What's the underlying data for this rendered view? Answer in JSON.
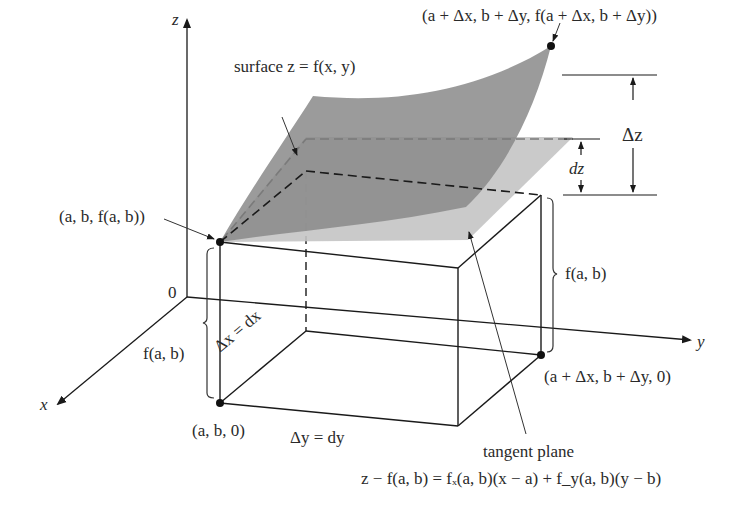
{
  "diagram": {
    "axes": {
      "z_label": "z",
      "x_label": "x",
      "y_label": "y",
      "origin_label": "0"
    },
    "labels": {
      "top_point": "(a + Δx, b + Δy, f(a + Δx, b + Δy))",
      "surface": "surface z = f(x, y)",
      "delta_z": "Δz",
      "dz": "dz",
      "base_point_top": "(a, b, f(a, b))",
      "f_ab_right": "f(a, b)",
      "f_ab_left": "f(a, b)",
      "delta_x": "Δx = dx",
      "delta_y": "Δy = dy",
      "base_point_ground": "(a, b, 0)",
      "far_ground_point": "(a + Δx, b + Δy, 0)",
      "tangent_plane": "tangent plane",
      "tangent_equation": "z − f(a, b) = fₓ(a, b)(x − a) + f_y(a, b)(y − b)"
    },
    "colors": {
      "surface_fill": "#8a8a8a",
      "plane_fill": "#c4c4c4",
      "line": "#1a1a1a",
      "text": "#2a2a2a"
    }
  }
}
